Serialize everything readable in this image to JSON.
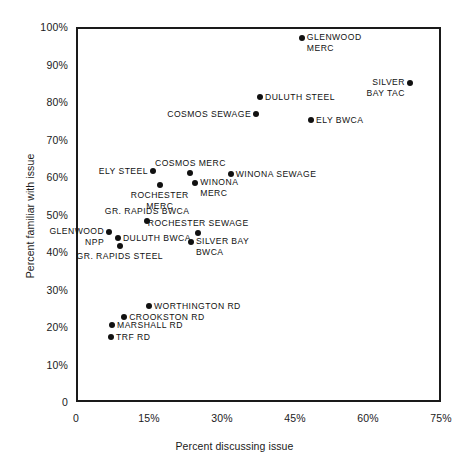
{
  "chart_data": {
    "type": "scatter",
    "title": "",
    "xlabel": "Percent discussing issue",
    "ylabel": "Percent familiar with issue",
    "xlim": [
      0,
      75
    ],
    "ylim": [
      0,
      100
    ],
    "grid": false,
    "legend": "none",
    "xticks": [
      "0",
      "15%",
      "30%",
      "45%",
      "60%",
      "75%"
    ],
    "xtick_values": [
      0,
      15,
      30,
      45,
      60,
      75
    ],
    "yticks": [
      "0",
      "10%",
      "20%",
      "30%",
      "40%",
      "50%",
      "60%",
      "70%",
      "80%",
      "90%",
      "100%"
    ],
    "ytick_values": [
      0,
      10,
      20,
      30,
      40,
      50,
      60,
      70,
      80,
      90,
      100
    ],
    "points": [
      {
        "label": "GLENWOOD\nMERC",
        "x": 46.0,
        "y": 97.5,
        "pos": "right"
      },
      {
        "label": "SILVER\nBAY TAC",
        "x": 68.2,
        "y": 85.5,
        "pos": "left-top"
      },
      {
        "label": "DULUTH STEEL",
        "x": 37.4,
        "y": 82.0,
        "pos": "right"
      },
      {
        "label": "COSMOS SEWAGE",
        "x": 36.6,
        "y": 77.3,
        "pos": "left"
      },
      {
        "label": "ELY BWCA",
        "x": 47.9,
        "y": 75.7,
        "pos": "right"
      },
      {
        "label": "COSMOS MERC",
        "x": 23.1,
        "y": 61.6,
        "pos": "above"
      },
      {
        "label": "WINONA SEWAGE",
        "x": 31.4,
        "y": 61.3,
        "pos": "right"
      },
      {
        "label": "ELY STEEL",
        "x": 15.4,
        "y": 62.1,
        "pos": "left"
      },
      {
        "label": "WINONA\nMERC",
        "x": 24.1,
        "y": 58.9,
        "pos": "right"
      },
      {
        "label": "ROCHESTER\nMERC",
        "x": 16.8,
        "y": 58.4,
        "pos": "below"
      },
      {
        "label": "GR. RAPIDS BWCA",
        "x": 14.2,
        "y": 48.7,
        "pos": "above"
      },
      {
        "label": "GLENWOOD\nNPP",
        "x": 6.4,
        "y": 45.8,
        "pos": "left-top"
      },
      {
        "label": "DULUTH BWCA",
        "x": 8.2,
        "y": 44.2,
        "pos": "right"
      },
      {
        "label": "GR. RAPIDS STEEL",
        "x": 8.6,
        "y": 42.1,
        "pos": "below"
      },
      {
        "label": "ROCHESTER SEWAGE",
        "x": 24.7,
        "y": 45.5,
        "pos": "above"
      },
      {
        "label": "SILVER BAY\nBWCA",
        "x": 23.2,
        "y": 43.2,
        "pos": "right"
      },
      {
        "label": "WORTHINGTON RD",
        "x": 14.6,
        "y": 26.2,
        "pos": "right"
      },
      {
        "label": "CROOKSTON RD",
        "x": 9.5,
        "y": 23.2,
        "pos": "right"
      },
      {
        "label": "MARSHALL RD",
        "x": 7.0,
        "y": 21.1,
        "pos": "right"
      },
      {
        "label": "TRF RD",
        "x": 6.8,
        "y": 18.0,
        "pos": "right"
      }
    ]
  }
}
